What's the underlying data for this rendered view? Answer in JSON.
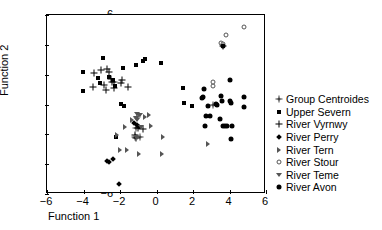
{
  "axes": {
    "x_title": "Function 1",
    "y_title": "Function 2",
    "x_ticks": [
      "-6",
      "-4",
      "-2",
      "0",
      "2",
      "4",
      "6"
    ],
    "y_ticks": [
      "-6",
      "-4",
      "-2",
      "0",
      "2",
      "4",
      "6"
    ]
  },
  "legend": {
    "items": [
      {
        "label": "Group Centroides",
        "marker": "star-icon",
        "color": "#444444"
      },
      {
        "label": "Upper Severn",
        "marker": "square-icon",
        "color": "#000000"
      },
      {
        "label": "River Vyrnwy",
        "marker": "plus-icon",
        "color": "#000000"
      },
      {
        "label": "River Perry",
        "marker": "diamond-icon",
        "color": "#000000"
      },
      {
        "label": "River Tern",
        "marker": "triangle-right-icon",
        "color": "#555555"
      },
      {
        "label": "River Stour",
        "marker": "open-circle-icon",
        "color": "#555555"
      },
      {
        "label": "River Teme",
        "marker": "triangle-down-icon",
        "color": "#555555"
      },
      {
        "label": "River Avon",
        "marker": "circle-icon",
        "color": "#000000"
      }
    ]
  },
  "chart_data": {
    "type": "scatter",
    "title": "",
    "xlabel": "Function 1",
    "ylabel": "Function 2",
    "xlim": [
      -6,
      6
    ],
    "ylim": [
      -6,
      6
    ],
    "xticks": [
      -6,
      -4,
      -2,
      0,
      2,
      4,
      6
    ],
    "yticks": [
      -6,
      -4,
      -2,
      0,
      2,
      4,
      6
    ],
    "grid": false,
    "legend_position": "right",
    "series": [
      {
        "name": "Group Centroides",
        "marker": "star",
        "color": "#444444",
        "points": [
          [
            -2.35,
            1.52
          ],
          [
            -1.12,
            -1.55
          ],
          [
            -0.88,
            -2.18
          ],
          [
            3.12,
            -0.04
          ],
          [
            -1.05,
            -0.82
          ],
          [
            -1.18,
            -2.2
          ]
        ]
      },
      {
        "name": "Upper Severn",
        "marker": "square",
        "color": "#000000",
        "points": [
          [
            -4.05,
            2.18
          ],
          [
            -4.05,
            0.9
          ],
          [
            -2.92,
            3.12
          ],
          [
            -3.2,
            1.75
          ],
          [
            -3.1,
            1.42
          ],
          [
            -2.62,
            1.82
          ],
          [
            -2.25,
            1.22
          ],
          [
            -2.4,
            1.62
          ],
          [
            -1.85,
            2.45
          ],
          [
            -1.95,
            0.05
          ],
          [
            -1.78,
            -0.12
          ],
          [
            -1.1,
            2.62
          ],
          [
            -0.72,
            2.92
          ],
          [
            -0.62,
            3.02
          ],
          [
            0.25,
            2.78
          ],
          [
            -2.2,
            -2.2
          ],
          [
            1.45,
            1.08
          ],
          [
            1.5,
            0.12
          ],
          [
            1.92,
            -0.1
          ]
        ]
      },
      {
        "name": "River Vyrnwy",
        "marker": "plus",
        "color": "#000000",
        "points": [
          [
            -3.45,
            2.08
          ],
          [
            -3.5,
            1.18
          ],
          [
            -3.05,
            2.28
          ],
          [
            -2.72,
            2.38
          ],
          [
            -2.62,
            2.18
          ],
          [
            -2.48,
            1.72
          ],
          [
            -2.45,
            1.48
          ],
          [
            -2.35,
            1.08
          ],
          [
            -2.9,
            1.32
          ],
          [
            -2.78,
            0.98
          ],
          [
            -1.9,
            1.65
          ],
          [
            -1.95,
            1.42
          ],
          [
            -1.55,
            1.18
          ],
          [
            -1.02,
            -1.55
          ],
          [
            -0.75,
            -1.62
          ],
          [
            -1.2,
            -2.05
          ],
          [
            -1.1,
            -2.22
          ],
          [
            3.62,
            3.92
          ]
        ]
      },
      {
        "name": "River Perry",
        "marker": "diamond",
        "color": "#000000",
        "points": [
          [
            -2.72,
            -3.78
          ],
          [
            -2.62,
            -3.88
          ],
          [
            -2.38,
            -3.68
          ],
          [
            -2.05,
            -5.35
          ],
          [
            -1.25,
            -1.22
          ],
          [
            -1.05,
            -1.38
          ],
          [
            -0.98,
            -1.52
          ]
        ]
      },
      {
        "name": "River Tern",
        "marker": "triangle-right",
        "color": "#555555",
        "points": [
          [
            -2.18,
            -2.02
          ],
          [
            -1.72,
            -1.48
          ],
          [
            -1.98,
            -3.05
          ],
          [
            -1.62,
            -3.05
          ],
          [
            -0.95,
            -3.35
          ],
          [
            0.28,
            -3.32
          ],
          [
            -0.32,
            -1.42
          ],
          [
            0.35,
            -2.2
          ],
          [
            -1.32,
            -1.02
          ],
          [
            2.82,
            -2.62
          ],
          [
            -0.42,
            -0.72
          ],
          [
            -0.62,
            -0.82
          ]
        ]
      },
      {
        "name": "River Stour",
        "marker": "open-circle",
        "color": "#555555",
        "points": [
          [
            3.52,
            4.12
          ],
          [
            3.62,
            4.08
          ],
          [
            3.82,
            4.68
          ],
          [
            4.82,
            5.18
          ],
          [
            3.12,
            1.22
          ],
          [
            3.08,
            1.48
          ]
        ]
      },
      {
        "name": "River Teme",
        "marker": "triangle-down",
        "color": "#555555",
        "points": [
          [
            -1.08,
            -0.65
          ],
          [
            -0.98,
            -0.68
          ],
          [
            -0.88,
            -0.68
          ],
          [
            -1.15,
            -0.92
          ],
          [
            -1.05,
            -1.02
          ],
          [
            -0.85,
            -1.48
          ],
          [
            -1.15,
            -2.2
          ],
          [
            -1.05,
            -2.22
          ]
        ]
      },
      {
        "name": "River Avon",
        "marker": "circle",
        "color": "#000000",
        "points": [
          [
            2.62,
            1.05
          ],
          [
            2.55,
            0.52
          ],
          [
            2.48,
            0.42
          ],
          [
            2.82,
            -0.12
          ],
          [
            2.72,
            -0.75
          ],
          [
            2.95,
            -0.78
          ],
          [
            2.68,
            -1.45
          ],
          [
            3.28,
            0.02
          ],
          [
            3.32,
            -0.02
          ],
          [
            3.55,
            0.58
          ],
          [
            3.58,
            0.22
          ],
          [
            3.48,
            -0.95
          ],
          [
            3.62,
            -1.45
          ],
          [
            3.78,
            -1.42
          ],
          [
            3.88,
            -1.42
          ],
          [
            4.05,
            1.62
          ],
          [
            4.05,
            0.22
          ],
          [
            4.08,
            0.12
          ],
          [
            4.12,
            -1.42
          ],
          [
            4.08,
            -2.32
          ],
          [
            4.78,
            0.52
          ],
          [
            4.82,
            -0.18
          ],
          [
            3.62,
            3.92
          ]
        ]
      }
    ]
  }
}
